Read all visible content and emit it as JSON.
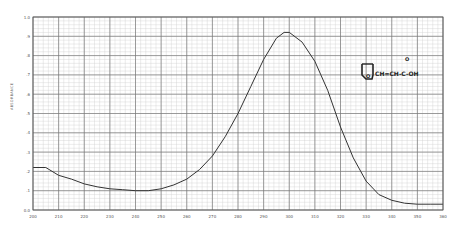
{
  "chart_data": {
    "type": "line",
    "title": "",
    "xlabel": "",
    "ylabel": "ABSORBANCE",
    "xlim": [
      200,
      360
    ],
    "ylim": [
      0.0,
      1.0
    ],
    "grid": true,
    "legend": null,
    "x_ticks": [
      "200",
      "210",
      "220",
      "230",
      "240",
      "250",
      "260",
      "270",
      "280",
      "290",
      "300",
      "310",
      "320",
      "330",
      "340",
      "350",
      "360"
    ],
    "y_ticks": [
      "0.0",
      ".1",
      ".2",
      ".3",
      ".4",
      ".5",
      ".6",
      ".7",
      ".8",
      ".9",
      "1.0"
    ],
    "annotation": "furylacrylic acid structure: furan ring–CH=CH–C(=O)–OH",
    "structure_text": "CH=CH-C-OH",
    "structure_carbonyl": "O",
    "series": [
      {
        "name": "absorbance",
        "x": [
          200,
          205,
          210,
          215,
          220,
          225,
          230,
          235,
          240,
          245,
          250,
          255,
          260,
          265,
          270,
          275,
          280,
          285,
          290,
          295,
          298,
          300,
          305,
          310,
          315,
          320,
          325,
          330,
          335,
          340,
          345,
          350,
          355,
          360
        ],
        "values": [
          0.22,
          0.22,
          0.18,
          0.16,
          0.135,
          0.12,
          0.11,
          0.105,
          0.1,
          0.1,
          0.11,
          0.13,
          0.16,
          0.21,
          0.28,
          0.38,
          0.5,
          0.64,
          0.78,
          0.89,
          0.92,
          0.92,
          0.87,
          0.77,
          0.62,
          0.43,
          0.27,
          0.15,
          0.08,
          0.05,
          0.035,
          0.03,
          0.03,
          0.03
        ]
      }
    ]
  },
  "colors": {
    "grid_major": "#777777",
    "grid_minor": "#cfcfcf",
    "curve": "#333333",
    "background": "#ffffff"
  }
}
